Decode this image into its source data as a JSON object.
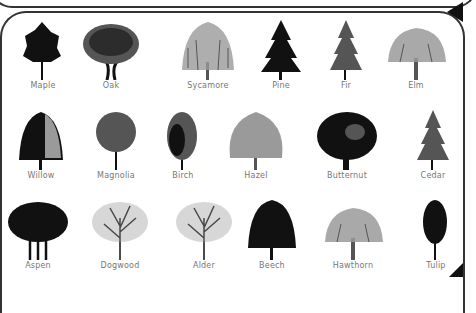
{
  "trees": [
    {
      "name": "Maple",
      "x": 43,
      "y": 88,
      "style": "dense-dark"
    },
    {
      "name": "Oak",
      "x": 111,
      "y": 88,
      "style": "spreading"
    },
    {
      "name": "Sycamore",
      "x": 208,
      "y": 88,
      "style": "weeping-light"
    },
    {
      "name": "Pine",
      "x": 281,
      "y": 88,
      "style": "conifer-dark"
    },
    {
      "name": "Fir",
      "x": 346,
      "y": 88,
      "style": "conifer"
    },
    {
      "name": "Elm",
      "x": 416,
      "y": 88,
      "style": "wide-light"
    },
    {
      "name": "Willow",
      "x": 41,
      "y": 178,
      "style": "weeping-dark"
    },
    {
      "name": "Magnolia",
      "x": 116,
      "y": 178,
      "style": "round"
    },
    {
      "name": "Birch",
      "x": 183,
      "y": 178,
      "style": "oval"
    },
    {
      "name": "Hazel",
      "x": 256,
      "y": 178,
      "style": "shrub"
    },
    {
      "name": "Butternut",
      "x": 347,
      "y": 178,
      "style": "wide-dark"
    },
    {
      "name": "Cedar",
      "x": 433,
      "y": 178,
      "style": "conifer"
    },
    {
      "name": "Aspen",
      "x": 38,
      "y": 268,
      "style": "cluster-dark"
    },
    {
      "name": "Dogwood",
      "x": 120,
      "y": 268,
      "style": "sparse"
    },
    {
      "name": "Alder",
      "x": 204,
      "y": 268,
      "style": "sparse"
    },
    {
      "name": "Beech",
      "x": 272,
      "y": 268,
      "style": "oval-dark"
    },
    {
      "name": "Hawthorn",
      "x": 353,
      "y": 268,
      "style": "wide-light"
    },
    {
      "name": "Tulip",
      "x": 436,
      "y": 268,
      "style": "narrow-dark"
    }
  ],
  "colors": {
    "ink": "#111111",
    "mid": "#555555",
    "light": "#9a9a9a",
    "label": "#777777"
  }
}
